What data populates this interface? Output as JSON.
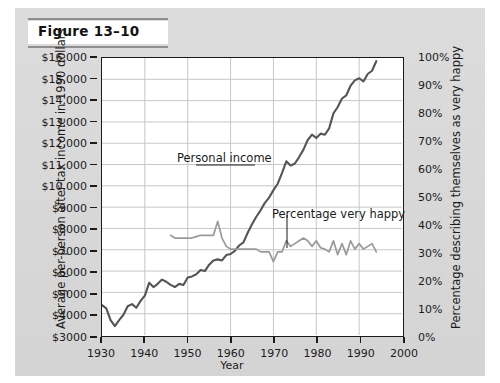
{
  "figure": {
    "title": "Figure 13–10"
  },
  "chart_data": {
    "type": "line",
    "title": "Figure 13–10",
    "xlabel": "Year",
    "ylabel_left": "Average per-person after-tax income in 1990 dollars",
    "ylabel_right": "Percentage describing themselves as very happy",
    "xlim": [
      1930,
      2000
    ],
    "ylim_left": [
      3000,
      16000
    ],
    "ylim_right": [
      0,
      100
    ],
    "grid": true,
    "legend": "annotations",
    "x_ticks": [
      "1930",
      "1940",
      "1950",
      "1960",
      "1970",
      "1980",
      "1990",
      "2000"
    ],
    "y_ticks_left": [
      "$3000",
      "$4000",
      "$5000",
      "$6000",
      "$7000",
      "$8000",
      "$9000",
      "$10,000",
      "$11,000",
      "$12,000",
      "$13,000",
      "$14,000",
      "$15,000",
      "$16,000"
    ],
    "y_ticks_right": [
      "0%",
      "10%",
      "20%",
      "30%",
      "40%",
      "50%",
      "60%",
      "70%",
      "80%",
      "90%",
      "100%"
    ],
    "annotations": [
      {
        "text": "Personal income",
        "color": "#555555"
      },
      {
        "text": "Percentage very happy",
        "color": "#9a9a9a"
      }
    ],
    "series": [
      {
        "name": "Personal income",
        "axis": "left",
        "color": "#555555",
        "x": [
          1930,
          1931,
          1932,
          1933,
          1934,
          1935,
          1936,
          1937,
          1938,
          1939,
          1940,
          1941,
          1942,
          1943,
          1944,
          1945,
          1946,
          1947,
          1948,
          1949,
          1950,
          1951,
          1952,
          1953,
          1954,
          1955,
          1956,
          1957,
          1958,
          1959,
          1960,
          1961,
          1962,
          1963,
          1964,
          1965,
          1966,
          1967,
          1968,
          1969,
          1970,
          1971,
          1972,
          1973,
          1974,
          1975,
          1976,
          1977,
          1978,
          1979,
          1980,
          1981,
          1982,
          1983,
          1984,
          1985,
          1986,
          1987,
          1988,
          1989,
          1990,
          1991,
          1992,
          1993,
          1994
        ],
        "values": [
          4400,
          4250,
          3700,
          3420,
          3700,
          3950,
          4350,
          4450,
          4280,
          4600,
          4850,
          5450,
          5250,
          5400,
          5600,
          5500,
          5350,
          5250,
          5400,
          5350,
          5700,
          5750,
          5850,
          6050,
          6000,
          6300,
          6500,
          6550,
          6500,
          6750,
          6800,
          6950,
          7200,
          7350,
          7800,
          8200,
          8550,
          8850,
          9200,
          9450,
          9800,
          10100,
          10600,
          11150,
          10950,
          11050,
          11350,
          11700,
          12150,
          12400,
          12250,
          12450,
          12400,
          12700,
          13400,
          13700,
          14100,
          14250,
          14700,
          14950,
          15050,
          14900,
          15250,
          15400,
          15850
        ]
      },
      {
        "name": "Percentage very happy",
        "axis": "right",
        "color": "#9a9a9a",
        "x": [
          1946,
          1947,
          1948,
          1949,
          1950,
          1951,
          1952,
          1953,
          1954,
          1955,
          1956,
          1957,
          1958,
          1959,
          1960,
          1961,
          1962,
          1963,
          1964,
          1965,
          1966,
          1967,
          1968,
          1969,
          1970,
          1971,
          1972,
          1973,
          1974,
          1975,
          1976,
          1977,
          1978,
          1979,
          1980,
          1981,
          1982,
          1983,
          1984,
          1985,
          1986,
          1987,
          1988,
          1989,
          1990,
          1991,
          1992,
          1993,
          1994
        ],
        "values": [
          36,
          35,
          35,
          35,
          35,
          35,
          35.5,
          36,
          36,
          36,
          36,
          41,
          35,
          32,
          31,
          31,
          31,
          31,
          31,
          31,
          31,
          30,
          30,
          30,
          26.5,
          30,
          30,
          34,
          32,
          33,
          34,
          35,
          34,
          32,
          34,
          31.5,
          31,
          30,
          34,
          29,
          33,
          29,
          34,
          31,
          33,
          31,
          32,
          33,
          30
        ]
      }
    ]
  },
  "axes": {
    "x_title": "Year",
    "y_left_title": "Average per-person after-tax income in 1990 dollars",
    "y_right_title": "Percentage describing themselves as very happy"
  }
}
